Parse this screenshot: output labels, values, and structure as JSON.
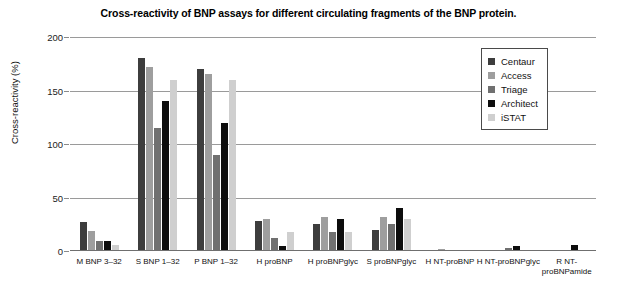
{
  "chart_data": {
    "type": "bar",
    "title": "Cross-reactivity of BNP assays for different circulating fragments of the BNP protein.",
    "xlabel": "",
    "ylabel": "Cross-reactivity (%)",
    "ylim": [
      0,
      200
    ],
    "yticks": [
      0,
      50,
      100,
      150,
      200
    ],
    "grid": true,
    "legend_position": "top-right",
    "categories": [
      "M BNP 3–32",
      "S BNP 1–32",
      "P BNP 1–32",
      "H proBNP",
      "H proBNPglyc",
      "S proBNPglyc",
      "H NT-proBNP",
      "H NT-proBNPglyc",
      "R NT-proBNPamide"
    ],
    "series": [
      {
        "name": "Centaur",
        "color": "#3d3d3d",
        "values": [
          27,
          180,
          170,
          28,
          25,
          20,
          0,
          0,
          0
        ]
      },
      {
        "name": "Access",
        "color": "#9e9e9e",
        "values": [
          19,
          172,
          165,
          30,
          32,
          32,
          2,
          0,
          0
        ]
      },
      {
        "name": "Triage",
        "color": "#707070",
        "values": [
          9,
          115,
          90,
          12,
          18,
          25,
          0,
          3,
          0
        ]
      },
      {
        "name": "Architect",
        "color": "#0d0d0d",
        "values": [
          9,
          140,
          120,
          5,
          30,
          40,
          0,
          5,
          6
        ]
      },
      {
        "name": "iSTAT",
        "color": "#cfcfcf",
        "values": [
          6,
          160,
          160,
          18,
          18,
          30,
          0,
          0,
          0
        ]
      }
    ]
  },
  "axes": {
    "y_tick_labels": [
      "0",
      "50",
      "100",
      "150",
      "200"
    ],
    "y_axis_title": "Cross-reactivity (%)"
  },
  "legend": {
    "entries": [
      {
        "label": "Centaur",
        "color": "#3d3d3d"
      },
      {
        "label": "Access",
        "color": "#9e9e9e"
      },
      {
        "label": "Triage",
        "color": "#707070"
      },
      {
        "label": "Architect",
        "color": "#0d0d0d"
      },
      {
        "label": "iSTAT",
        "color": "#cfcfcf"
      }
    ]
  }
}
